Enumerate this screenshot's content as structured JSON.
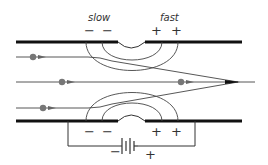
{
  "diagram": {
    "type": "electrostatic lens / velocity focusing diagram",
    "labels": {
      "slow": "slow",
      "fast": "fast"
    },
    "top_plate_charges": {
      "left": [
        "−",
        "−"
      ],
      "right": [
        "+",
        "+"
      ]
    },
    "bottom_plate_charges": {
      "left": [
        "−",
        "−"
      ],
      "right": [
        "+",
        "+"
      ]
    },
    "battery": {
      "negative_label": "−",
      "positive_label": "+"
    },
    "colors": {
      "line": "#333333",
      "plate": "#111111",
      "particle": "#777777",
      "background": "#ffffff"
    },
    "particles": [
      {
        "x": 33,
        "y": 57
      },
      {
        "x": 62,
        "y": 82
      },
      {
        "x": 181,
        "y": 82
      },
      {
        "x": 43,
        "y": 108
      }
    ]
  }
}
